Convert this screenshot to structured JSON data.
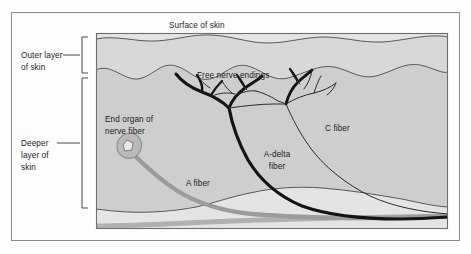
{
  "figure": {
    "width": 471,
    "height": 254
  },
  "labels": {
    "surface_of_skin": "Surface of skin",
    "outer_layer_line1": "Outer layer",
    "outer_layer_line2": "of skin",
    "deeper_layer_line1": "Deeper",
    "deeper_layer_line2": "layer of",
    "deeper_layer_line3": "skin",
    "free_nerve_endings": "Free nerve endings",
    "end_organ_line1": "End organ of",
    "end_organ_line2": "nerve fiber",
    "c_fiber": "C fiber",
    "a_delta_fiber_line1": "A-delta",
    "a_delta_fiber_line2": "fiber",
    "a_fiber": "A fiber"
  },
  "colors": {
    "page_background": "#fdfdfd",
    "outer_frame": "#8a8a8a",
    "panel_frame": "#6e6e6e",
    "outer_skin_fill": "#d6d6d6",
    "deeper_skin_fill": "#cfcfcf",
    "subcutaneous_fill": "#e2e2e2",
    "boundary_stroke": "#585858",
    "a_delta_nerve": "#141414",
    "c_fiber_nerve": "#2b2b2b",
    "a_fiber_gray": "#9b9b9b",
    "end_organ_body": "#b9b9b9",
    "end_organ_nucleus": "#e6e6e6",
    "label_text": "#1b1b1b",
    "bracket_stroke": "#4a4a4a"
  },
  "structures": [
    {
      "name": "outer-layer-of-skin",
      "label": "Outer layer of skin"
    },
    {
      "name": "deeper-layer-of-skin",
      "label": "Deeper layer of skin"
    },
    {
      "name": "free-nerve-endings",
      "label": "Free nerve endings"
    },
    {
      "name": "end-organ-of-nerve-fiber",
      "label": "End organ of nerve fiber"
    },
    {
      "name": "c-fiber",
      "label": "C fiber"
    },
    {
      "name": "a-delta-fiber",
      "label": "A-delta fiber"
    },
    {
      "name": "a-fiber",
      "label": "A fiber"
    }
  ]
}
